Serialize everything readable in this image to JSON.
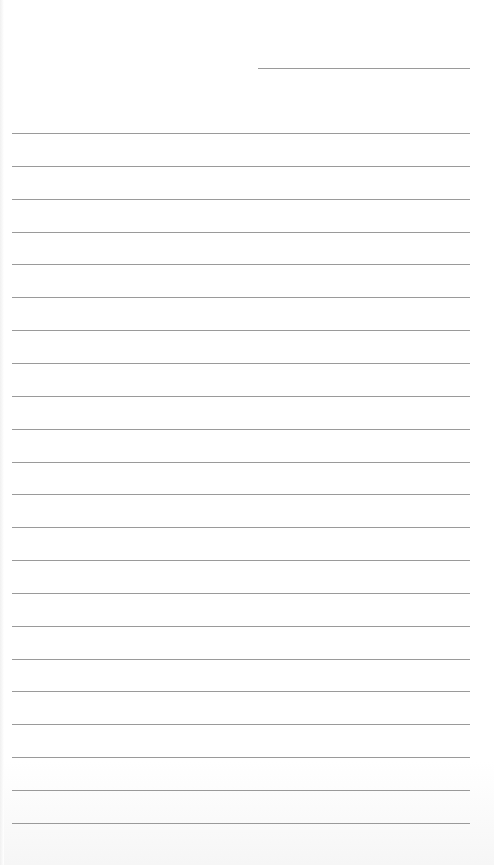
{
  "page": {
    "type": "lined writing sheet",
    "background_color": "#ffffff",
    "rule_color": "#9a9a9a"
  },
  "header_line": {
    "x": 258,
    "y": 68,
    "width": 212
  },
  "rules": {
    "count": 22,
    "x": 12,
    "width": 458,
    "first_y": 133,
    "spacing": 32.85
  }
}
